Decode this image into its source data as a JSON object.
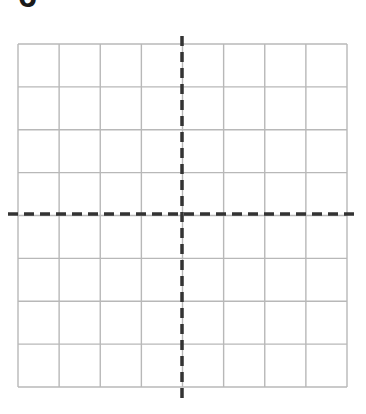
{
  "figure": {
    "label": "6",
    "grid": {
      "columns": 8,
      "rows": 8,
      "left": 18,
      "top": 44,
      "right": 347,
      "bottom": 387,
      "line_color": "#b8b8b8"
    },
    "axes": {
      "color": "#333333",
      "style": "dashed",
      "x_axis": {
        "y": 214,
        "x_start": 8,
        "x_end": 358
      },
      "y_axis": {
        "x": 182,
        "y_start": 36,
        "y_end": 402
      }
    }
  }
}
